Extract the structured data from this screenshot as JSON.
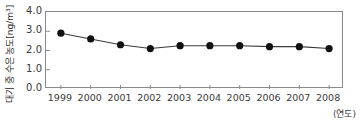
{
  "chart_data": {
    "type": "line",
    "title": "",
    "subtitle": "",
    "xlabel": "(연도)",
    "ylabel": "대기 중 수은 농도[ng/m³]",
    "categories": [
      "1999",
      "2000",
      "2001",
      "2002",
      "2003",
      "2004",
      "2005",
      "2006",
      "2007",
      "2008"
    ],
    "values": [
      2.9,
      2.6,
      2.3,
      2.1,
      2.25,
      2.25,
      2.25,
      2.2,
      2.2,
      2.1
    ],
    "series": [
      {
        "name": "대기 중 수은 농도",
        "values": [
          2.9,
          2.6,
          2.3,
          2.1,
          2.25,
          2.25,
          2.25,
          2.2,
          2.2,
          2.1
        ]
      }
    ],
    "x": [
      1999,
      2000,
      2001,
      2002,
      2003,
      2004,
      2005,
      2006,
      2007,
      2008
    ],
    "xlim": [
      1998.5,
      2008.5
    ],
    "ylim": [
      0.0,
      4.0
    ],
    "ytick_labels": [
      "4.0",
      "3.0",
      "2.0",
      "1.0",
      "0.0"
    ],
    "ytick_values": [
      4.0,
      3.0,
      2.0,
      1.0,
      0.0
    ],
    "xtick_labels": [
      "1999",
      "2000",
      "2001",
      "2002",
      "2003",
      "2004",
      "2005",
      "2006",
      "2007",
      "2008"
    ],
    "unit": "ng/m³",
    "grid": false,
    "legend": "none",
    "marker": "filled-circle",
    "line_color": "#3a3a3a",
    "marker_color": "#111111",
    "frame_color": "#8a8a8a",
    "background_color": "#ffffff",
    "annotations": []
  }
}
